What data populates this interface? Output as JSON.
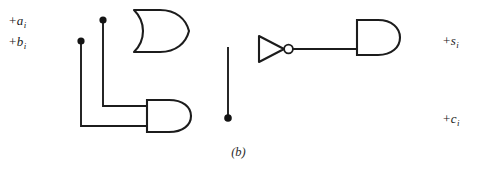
{
  "figure": {
    "caption": "(b)",
    "background_color": "#ffffff",
    "wire_color": "#1c1c1c",
    "accent_green": "#35c23a",
    "accent_magenta": "#9c3a78",
    "width": 477,
    "height": 174
  },
  "inputs": [
    {
      "sign": "+",
      "name": "a",
      "subscript": "i",
      "y": 20
    },
    {
      "sign": "+",
      "name": "b",
      "subscript": "i",
      "y": 41
    }
  ],
  "outputs": [
    {
      "sign": "+",
      "name": "s",
      "subscript": "i",
      "y": 40
    },
    {
      "sign": "+",
      "name": "c",
      "subscript": "i",
      "y": 118
    }
  ],
  "gates": [
    {
      "id": "or-gate",
      "type": "OR",
      "inputs": [
        "+ai",
        "+bi"
      ],
      "output": "a+b"
    },
    {
      "id": "and-gate-carry",
      "type": "AND",
      "inputs": [
        "+ai",
        "+bi"
      ],
      "output": "+ci"
    },
    {
      "id": "inverter",
      "type": "NOT",
      "inputs": [
        "+ci"
      ],
      "output": "not-ci"
    },
    {
      "id": "and-gate-sum",
      "type": "AND",
      "inputs": [
        "a+b",
        "not-ci"
      ],
      "output": "+si"
    }
  ],
  "junctions": [
    {
      "id": "junction-a",
      "x": 103,
      "y": 20
    },
    {
      "id": "junction-b",
      "x": 81,
      "y": 41
    },
    {
      "id": "junction-carry",
      "x": 228,
      "y": 118
    }
  ]
}
